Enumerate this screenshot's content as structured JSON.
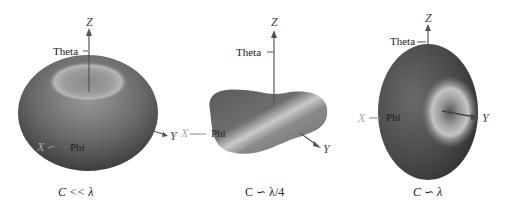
{
  "figure": {
    "panels": [
      {
        "id": "small-loop",
        "caption": "C << λ",
        "labels": {
          "z": "Z",
          "y": "Y",
          "x": "X",
          "theta": "Theta",
          "phi": "Phi"
        }
      },
      {
        "id": "quarter-wave",
        "caption": "C ∽ λ/4",
        "labels": {
          "z": "Z",
          "y": "Y",
          "x": "X",
          "theta": "Theta",
          "phi": "Phi",
          "neg_y": "-Y"
        }
      },
      {
        "id": "full-wave",
        "caption": "C ∽ λ",
        "labels": {
          "z": "Z",
          "y": "Y",
          "x": "X",
          "theta": "Theta",
          "phi": "Phi"
        }
      }
    ],
    "colors": {
      "surface_dark": "#3a3a3a",
      "surface_mid": "#707070",
      "surface_light": "#c8c8c8",
      "axis": "#555555"
    }
  }
}
